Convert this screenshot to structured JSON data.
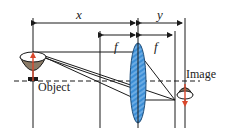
{
  "diagram": {
    "type": "thin convex lens image formation",
    "labels": {
      "object_distance": "x",
      "image_distance": "y",
      "focal_left": "f",
      "focal_right": "f",
      "object": "Object",
      "image": "Image"
    },
    "colors": {
      "line": "#1a1a1a",
      "lens_fill": "#3d8fd6",
      "lens_stroke": "#1f4e7a",
      "arrow": "#d9472b",
      "bowl_outer": "#8a7a66",
      "bowl_inner": "#ffffff"
    }
  }
}
